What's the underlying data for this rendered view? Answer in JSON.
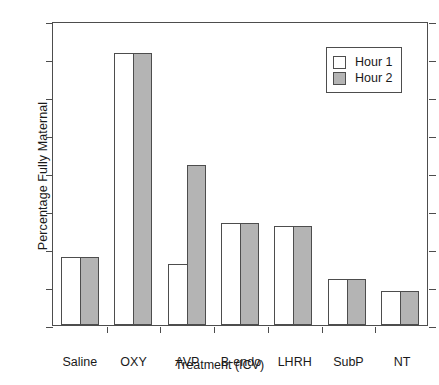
{
  "chart_data": {
    "type": "bar",
    "title": "",
    "xlabel": "Treatment (ICV)",
    "ylabel": "Percentage Fully Maternal",
    "categories": [
      "Saline",
      "OXY",
      "AVP",
      "B-endo",
      "LHRH",
      "SubP",
      "NT"
    ],
    "series": [
      {
        "name": "Hour 1",
        "color": "#ffffff",
        "values": [
          18,
          71.5,
          16,
          26.8,
          26,
          12,
          9
        ]
      },
      {
        "name": "Hour 2",
        "color": "#b4b4b4",
        "values": [
          18,
          71.5,
          42,
          26.8,
          26,
          12,
          9
        ]
      }
    ],
    "ylim": [
      0,
      80
    ],
    "yticks": [
      0,
      10,
      20,
      30,
      40,
      50,
      60,
      70,
      80
    ],
    "ytick_labels": [
      "0",
      "10",
      "20",
      "30",
      "40",
      "50",
      "60",
      "70",
      "80"
    ],
    "grid": false,
    "legend_position": "top-right"
  },
  "legend": {
    "entries": [
      {
        "label": "Hour 1"
      },
      {
        "label": "Hour 2"
      }
    ]
  }
}
